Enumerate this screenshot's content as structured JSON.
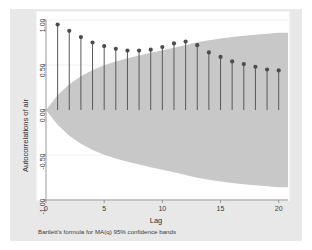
{
  "chart_data": {
    "type": "scatter",
    "title": "",
    "subtitle": "",
    "xlabel": "Lag",
    "ylabel": "Autocorrelations of air",
    "note": "Bartlett's formula for MA(q) 95% confidence bands",
    "xlim": [
      0,
      20.8
    ],
    "ylim": [
      -1.0,
      1.0
    ],
    "grid": true,
    "grid_axis": "y",
    "legend": "none",
    "xticks": [
      0,
      5,
      10,
      15,
      20
    ],
    "xtick_labels": [
      "0",
      "5",
      "10",
      "15",
      "20"
    ],
    "yticks": [
      -1.0,
      -0.5,
      0.0,
      0.5,
      1.0
    ],
    "ytick_labels": [
      "-1.00",
      "-0.50",
      "0.00",
      "0.50",
      "1.00"
    ],
    "x": [
      1,
      2,
      3,
      4,
      5,
      6,
      7,
      8,
      9,
      10,
      11,
      12,
      13,
      14,
      15,
      16,
      17,
      18,
      19,
      20
    ],
    "values": [
      0.95,
      0.88,
      0.81,
      0.75,
      0.71,
      0.68,
      0.66,
      0.66,
      0.67,
      0.7,
      0.74,
      0.76,
      0.72,
      0.64,
      0.59,
      0.54,
      0.51,
      0.48,
      0.45,
      0.44
    ],
    "series": [
      {
        "name": "Autocorrelations of air",
        "marker": "circle",
        "stems": true,
        "values": [
          0.95,
          0.88,
          0.81,
          0.75,
          0.71,
          0.68,
          0.66,
          0.66,
          0.67,
          0.7,
          0.74,
          0.76,
          0.72,
          0.64,
          0.59,
          0.54,
          0.51,
          0.48,
          0.45,
          0.44
        ]
      }
    ],
    "confidence_band": {
      "label": "Bartlett's formula for MA(q) 95% confidence bands",
      "level": 95,
      "upper": [
        0.163,
        0.285,
        0.376,
        0.444,
        0.497,
        0.54,
        0.575,
        0.606,
        0.635,
        0.663,
        0.692,
        0.723,
        0.752,
        0.776,
        0.794,
        0.81,
        0.824,
        0.836,
        0.847,
        0.857
      ],
      "lower": [
        -0.163,
        -0.285,
        -0.376,
        -0.444,
        -0.497,
        -0.54,
        -0.575,
        -0.606,
        -0.635,
        -0.663,
        -0.692,
        -0.723,
        -0.752,
        -0.776,
        -0.794,
        -0.81,
        -0.824,
        -0.836,
        -0.847,
        -0.857
      ]
    },
    "colors": {
      "background": "#ffffff",
      "graph_region": "#e8e8e8",
      "band_fill": "#c8c8c8",
      "marker": "#4d4d4d",
      "stem": "#595959",
      "grid": "#f0f0f0",
      "axis": "#8c8c8c",
      "text": "#3a3a3a"
    }
  }
}
